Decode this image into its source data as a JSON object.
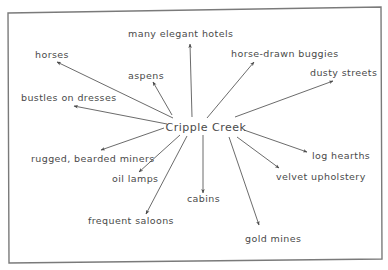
{
  "diagram": {
    "type": "web-diagram",
    "center": {
      "label": "Cripple Creek"
    },
    "nodes": [
      {
        "id": "horses",
        "label": "horses"
      },
      {
        "id": "many-elegant-hotels",
        "label": "many elegant hotels"
      },
      {
        "id": "horse-drawn-buggies",
        "label": "horse-drawn buggies"
      },
      {
        "id": "dusty-streets",
        "label": "dusty streets"
      },
      {
        "id": "aspens",
        "label": "aspens"
      },
      {
        "id": "bustles-on-dresses",
        "label": "bustles on dresses"
      },
      {
        "id": "rugged-bearded-miners",
        "label": "rugged, bearded miners"
      },
      {
        "id": "oil-lamps",
        "label": "oil lamps"
      },
      {
        "id": "frequent-saloons",
        "label": "frequent saloons"
      },
      {
        "id": "cabins",
        "label": "cabins"
      },
      {
        "id": "gold-mines",
        "label": "gold mines"
      },
      {
        "id": "log-hearths",
        "label": "log hearths"
      },
      {
        "id": "velvet-upholstery",
        "label": "velvet upholstery"
      }
    ],
    "edges": [
      {
        "from": "center",
        "to": "horses"
      },
      {
        "from": "center",
        "to": "many-elegant-hotels"
      },
      {
        "from": "center",
        "to": "horse-drawn-buggies"
      },
      {
        "from": "center",
        "to": "dusty-streets"
      },
      {
        "from": "center",
        "to": "aspens"
      },
      {
        "from": "center",
        "to": "bustles-on-dresses"
      },
      {
        "from": "center",
        "to": "rugged-bearded-miners"
      },
      {
        "from": "center",
        "to": "oil-lamps"
      },
      {
        "from": "center",
        "to": "frequent-saloons"
      },
      {
        "from": "center",
        "to": "cabins"
      },
      {
        "from": "center",
        "to": "gold-mines"
      },
      {
        "from": "center",
        "to": "log-hearths"
      },
      {
        "from": "center",
        "to": "velvet-upholstery"
      }
    ]
  }
}
